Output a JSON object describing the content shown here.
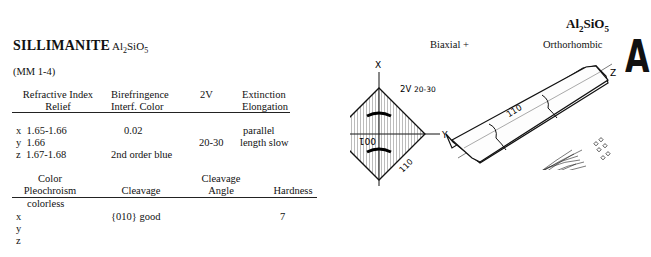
{
  "mineral": {
    "name": "SILLIMANITE",
    "formula_parts": [
      "Al",
      "2",
      "SiO",
      "5"
    ],
    "reference": "(MM 1-4)"
  },
  "header_right": {
    "formula_parts": [
      "Al",
      "2",
      "SiO",
      "5"
    ],
    "optic_sign": "Biaxial +",
    "crystal_system": "Orthorhombic",
    "section_letter": "A"
  },
  "optics_table": {
    "headers": [
      {
        "line1": "Refractive Index",
        "line2": "Relief"
      },
      {
        "line1": "Birefringence",
        "line2": "Interf. Color"
      },
      {
        "line1": "2V",
        "line2": ""
      },
      {
        "line1": "Extinction",
        "line2": "Elongation"
      }
    ],
    "refractive_index": [
      {
        "axis": "x",
        "value": "1.65-1.66"
      },
      {
        "axis": "y",
        "value": "1.66"
      },
      {
        "axis": "z",
        "value": "1.67-1.68"
      }
    ],
    "birefringence": "0.02",
    "interference_color": "2nd order blue",
    "two_v": "20-30",
    "extinction": "parallel",
    "elongation": "length slow"
  },
  "physical_table": {
    "headers": [
      {
        "line1": "Color",
        "line2": "Pleochroism"
      },
      {
        "line1": "",
        "line2": "Cleavage"
      },
      {
        "line1": "Cleavage",
        "line2": "Angle"
      },
      {
        "line1": "",
        "line2": "Hardness"
      }
    ],
    "color": "colorless",
    "pleochroism_axes": [
      "x",
      "y",
      "z"
    ],
    "cleavage": "{010} good",
    "cleavage_angle": "",
    "hardness": "7"
  },
  "figure": {
    "interference_figure": {
      "axis_top": "X",
      "axis_right": "Y",
      "two_v_label": "2V",
      "two_v_value": "20-30",
      "face_left": "001",
      "face_bottom_right": "110"
    },
    "crystal": {
      "axis_label": "Z",
      "face_label": "110"
    }
  }
}
